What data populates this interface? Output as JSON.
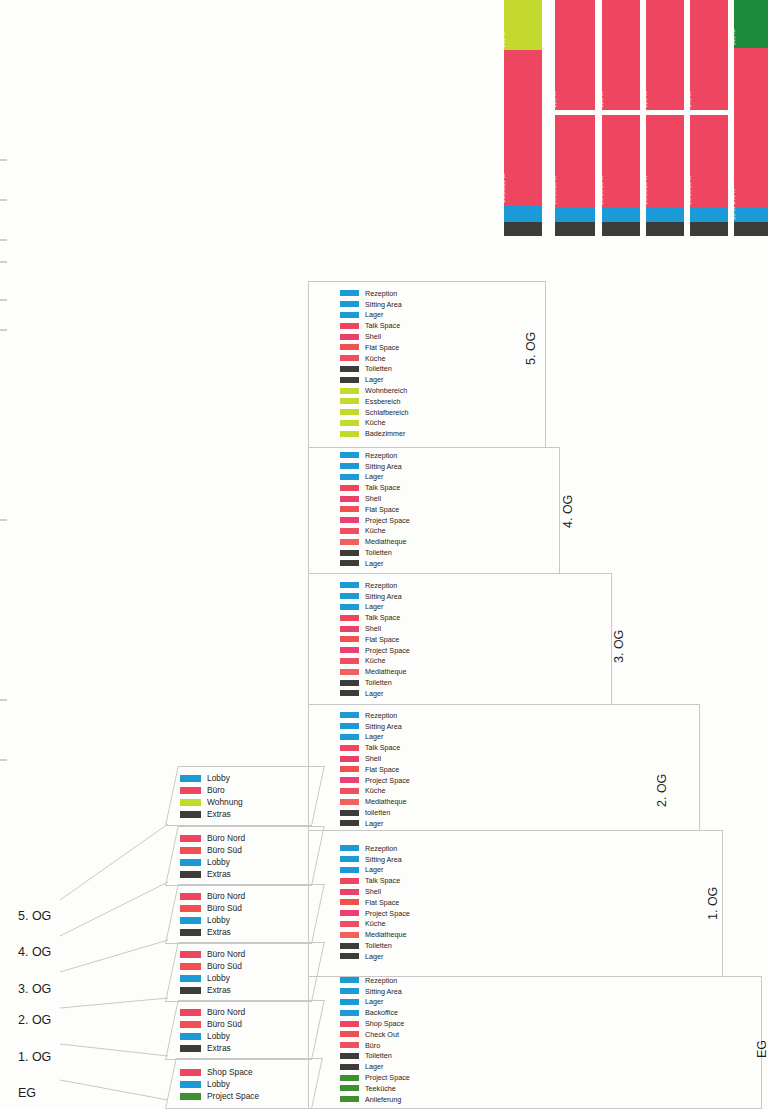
{
  "diagram": {
    "floor_labels_left": [
      "5. OG",
      "4. OG",
      "3. OG",
      "2. OG",
      "1. OG",
      "EG"
    ],
    "floor_label_eg_right": "EG"
  },
  "chart_data": {
    "type": "bar",
    "xlabel": "",
    "ylabel": "Fläche m²",
    "unit": "m²",
    "orientation": "vertical-stacked",
    "categories": [
      "5. OG",
      "4. OG",
      "3. OG",
      "2. OG",
      "1. OG",
      "EG"
    ],
    "columns": [
      {
        "name": "5. OG",
        "segments": [
          {
            "label": "100 m²",
            "value": 100,
            "color": "#c3d92e",
            "category": "Wohnung"
          },
          {
            "label": "20/20/20 m²",
            "value": 540,
            "color": "#ee4560",
            "category": "Büro"
          },
          {
            "label": "",
            "value": 28,
            "color": "#1b9ad6",
            "category": "Lobby"
          },
          {
            "label": "",
            "value": 26,
            "color": "#3c3c3b",
            "category": "Extras"
          }
        ]
      },
      {
        "name": "4. OG",
        "segments": [
          {
            "label": "220 m²",
            "value": 220,
            "color": "#ee4560",
            "category": "Büro Nord"
          },
          {
            "label": "20/20/20 m²",
            "value": 420,
            "color": "#ee4560",
            "category": "Büro Süd"
          },
          {
            "label": "",
            "value": 28,
            "color": "#1b9ad6",
            "category": "Lobby"
          },
          {
            "label": "",
            "value": 26,
            "color": "#3c3c3b",
            "category": "Extras"
          }
        ]
      },
      {
        "name": "3. OG",
        "segments": [
          {
            "label": "220 m²",
            "value": 220,
            "color": "#ee4560",
            "category": "Büro Nord"
          },
          {
            "label": "20/20/20 m²",
            "value": 420,
            "color": "#ee4560",
            "category": "Büro Süd"
          },
          {
            "label": "",
            "value": 28,
            "color": "#1b9ad6",
            "category": "Lobby"
          },
          {
            "label": "",
            "value": 26,
            "color": "#3c3c3b",
            "category": "Extras"
          }
        ]
      },
      {
        "name": "2. OG",
        "segments": [
          {
            "label": "220 m²",
            "value": 220,
            "color": "#ee4560",
            "category": "Büro Nord"
          },
          {
            "label": "20/20/20 m²",
            "value": 420,
            "color": "#ee4560",
            "category": "Büro Süd"
          },
          {
            "label": "",
            "value": 28,
            "color": "#1b9ad6",
            "category": "Lobby"
          },
          {
            "label": "",
            "value": 26,
            "color": "#3c3c3b",
            "category": "Extras"
          }
        ]
      },
      {
        "name": "1. OG",
        "segments": [
          {
            "label": "340 m²",
            "value": 340,
            "color": "#ee4560",
            "category": "Büro Nord"
          },
          {
            "label": "20/20/20 m²",
            "value": 420,
            "color": "#ee4560",
            "category": "Büro Süd"
          },
          {
            "label": "",
            "value": 28,
            "color": "#1b9ad6",
            "category": "Lobby"
          },
          {
            "label": "",
            "value": 26,
            "color": "#3c3c3b",
            "category": "Extras"
          }
        ]
      },
      {
        "name": "EG",
        "segments": [
          {
            "label": "100 m²",
            "value": 100,
            "color": "#1e8a3c",
            "category": "Project Space"
          },
          {
            "label": "340 m²",
            "value": 540,
            "color": "#ee4560",
            "category": "Shop Space"
          },
          {
            "label": "20 m²",
            "value": 28,
            "color": "#1b9ad6",
            "category": "Lobby"
          },
          {
            "label": "",
            "value": 26,
            "color": "#3c3c3b",
            "category": "Extras"
          }
        ]
      }
    ]
  },
  "colors": {
    "blue": "#1b9ad6",
    "pink": "#ee4560",
    "pink_light": "#f05a62",
    "dark": "#3c3c3b",
    "lime": "#c3d92e",
    "green": "#3f8f33",
    "green_dark": "#1e8a3c",
    "outline": "#c8c8c6"
  },
  "legends_right": [
    {
      "floor": "5. OG",
      "items": [
        {
          "label": "Rezeption",
          "color": "#1b9ad6"
        },
        {
          "label": "Sitting Area",
          "color": "#1b9ad6"
        },
        {
          "label": "Lager",
          "color": "#1b9ad6"
        },
        {
          "label": "Talk Space",
          "color": "#ee4560"
        },
        {
          "label": "Shell",
          "color": "#e8416a"
        },
        {
          "label": "Flat Space",
          "color": "#f0504f"
        },
        {
          "label": "Küche",
          "color": "#ef4f63"
        },
        {
          "label": "Toiletten",
          "color": "#3c3c3b"
        },
        {
          "label": "Lager",
          "color": "#3c3c3b"
        },
        {
          "label": "Wohnbereich",
          "color": "#c3d92e"
        },
        {
          "label": "Essbereich",
          "color": "#c3d92e"
        },
        {
          "label": "Schlafbereich",
          "color": "#c3d92e"
        },
        {
          "label": "Küche",
          "color": "#c3d92e"
        },
        {
          "label": "Badezimmer",
          "color": "#c3d92e"
        }
      ]
    },
    {
      "floor": "4. OG",
      "items": [
        {
          "label": "Rezeption",
          "color": "#1b9ad6"
        },
        {
          "label": "Sitting Area",
          "color": "#1b9ad6"
        },
        {
          "label": "Lager",
          "color": "#1b9ad6"
        },
        {
          "label": "Talk Space",
          "color": "#ee4560"
        },
        {
          "label": "Shell",
          "color": "#e8416a"
        },
        {
          "label": "Flat Space",
          "color": "#f0504f"
        },
        {
          "label": "Project Space",
          "color": "#ec3f74"
        },
        {
          "label": "Küche",
          "color": "#ef4f63"
        },
        {
          "label": "Mediatheque",
          "color": "#f1615e"
        },
        {
          "label": "Toiletten",
          "color": "#3c3c3b"
        },
        {
          "label": "Lager",
          "color": "#3c3c3b"
        }
      ]
    },
    {
      "floor": "3. OG",
      "items": [
        {
          "label": "Rezeption",
          "color": "#1b9ad6"
        },
        {
          "label": "Sitting Area",
          "color": "#1b9ad6"
        },
        {
          "label": "Lager",
          "color": "#1b9ad6"
        },
        {
          "label": "Talk Space",
          "color": "#ee4560"
        },
        {
          "label": "Shell",
          "color": "#e8416a"
        },
        {
          "label": "Flat Space",
          "color": "#f0504f"
        },
        {
          "label": "Project Space",
          "color": "#ec3f74"
        },
        {
          "label": "Küche",
          "color": "#ef4f63"
        },
        {
          "label": "Mediatheque",
          "color": "#f1615e"
        },
        {
          "label": "Toiletten",
          "color": "#3c3c3b"
        },
        {
          "label": "Lager",
          "color": "#3c3c3b"
        }
      ]
    },
    {
      "floor": "2. OG",
      "items": [
        {
          "label": "Rezeption",
          "color": "#1b9ad6"
        },
        {
          "label": "Sitting Area",
          "color": "#1b9ad6"
        },
        {
          "label": "Lager",
          "color": "#1b9ad6"
        },
        {
          "label": "Talk Space",
          "color": "#ee4560"
        },
        {
          "label": "Shell",
          "color": "#e8416a"
        },
        {
          "label": "Flat Space",
          "color": "#f0504f"
        },
        {
          "label": "Project Space",
          "color": "#ec3f74"
        },
        {
          "label": "Küche",
          "color": "#ef4f63"
        },
        {
          "label": "Mediatheque",
          "color": "#f1615e"
        },
        {
          "label": "toiletten",
          "color": "#3c3c3b"
        },
        {
          "label": "Lager",
          "color": "#3c3c3b"
        }
      ]
    },
    {
      "floor": "1. OG",
      "items": [
        {
          "label": "Rezeption",
          "color": "#1b9ad6"
        },
        {
          "label": "Sitting Area",
          "color": "#1b9ad6"
        },
        {
          "label": "Lager",
          "color": "#1b9ad6"
        },
        {
          "label": "Talk Space",
          "color": "#ee4560"
        },
        {
          "label": "Shell",
          "color": "#e8416a"
        },
        {
          "label": "Flat Space",
          "color": "#f0504f"
        },
        {
          "label": "Project Space",
          "color": "#ec3f74"
        },
        {
          "label": "Küche",
          "color": "#ef4f63"
        },
        {
          "label": "Mediatheque",
          "color": "#f1615e"
        },
        {
          "label": "Toiletten",
          "color": "#3c3c3b"
        },
        {
          "label": "Lager",
          "color": "#3c3c3b"
        }
      ]
    },
    {
      "floor": "EG",
      "items": [
        {
          "label": "Rezeption",
          "color": "#1b9ad6"
        },
        {
          "label": "Sitting Area",
          "color": "#1b9ad6"
        },
        {
          "label": "Lager",
          "color": "#1b9ad6"
        },
        {
          "label": "Backoffice",
          "color": "#1b9ad6"
        },
        {
          "label": "Shop Space",
          "color": "#ee4560"
        },
        {
          "label": "Check Out",
          "color": "#f0504f"
        },
        {
          "label": "Büro",
          "color": "#ef4f63"
        },
        {
          "label": "Toiletten",
          "color": "#3c3c3b"
        },
        {
          "label": "Lager",
          "color": "#3c3c3b"
        },
        {
          "label": "Project Space",
          "color": "#3f8f33"
        },
        {
          "label": "Teeküche",
          "color": "#3f8f33"
        },
        {
          "label": "Anlieferung",
          "color": "#3f8f33"
        }
      ]
    }
  ],
  "legends_left": [
    {
      "floor": "5. OG",
      "items": [
        {
          "label": "Lobby",
          "color": "#1b9ad6"
        },
        {
          "label": "Büro",
          "color": "#ee4560"
        },
        {
          "label": "Wohnung",
          "color": "#c3d92e"
        },
        {
          "label": "Extras",
          "color": "#3c3c3b"
        }
      ]
    },
    {
      "floor": "4. OG",
      "items": [
        {
          "label": "Büro Nord",
          "color": "#ee4560"
        },
        {
          "label": "Büro Süd",
          "color": "#f0504f"
        },
        {
          "label": "Lobby",
          "color": "#1b9ad6"
        },
        {
          "label": "Extras",
          "color": "#3c3c3b"
        }
      ]
    },
    {
      "floor": "3. OG",
      "items": [
        {
          "label": "Büro Nord",
          "color": "#ee4560"
        },
        {
          "label": "Büro Süd",
          "color": "#f0504f"
        },
        {
          "label": "Lobby",
          "color": "#1b9ad6"
        },
        {
          "label": "Extras",
          "color": "#3c3c3b"
        }
      ]
    },
    {
      "floor": "2. OG",
      "items": [
        {
          "label": "Büro Nord",
          "color": "#ee4560"
        },
        {
          "label": "Büro Süd",
          "color": "#f0504f"
        },
        {
          "label": "Lobby",
          "color": "#1b9ad6"
        },
        {
          "label": "Extras",
          "color": "#3c3c3b"
        }
      ]
    },
    {
      "floor": "1. OG",
      "items": [
        {
          "label": "Büro Nord",
          "color": "#ee4560"
        },
        {
          "label": "Büro Süd",
          "color": "#f0504f"
        },
        {
          "label": "Lobby",
          "color": "#1b9ad6"
        },
        {
          "label": "Extras",
          "color": "#3c3c3b"
        }
      ]
    },
    {
      "floor": "EG",
      "items": [
        {
          "label": "Shop Space",
          "color": "#ee4560"
        },
        {
          "label": "Lobby",
          "color": "#1b9ad6"
        },
        {
          "label": "Project Space",
          "color": "#3f8f33"
        }
      ]
    }
  ],
  "floor_boxes": [
    {
      "label": "5. OG"
    },
    {
      "label": "4. OG"
    },
    {
      "label": "3. OG"
    },
    {
      "label": "2. OG"
    },
    {
      "label": "1. OG"
    },
    {
      "label": "EG"
    }
  ]
}
